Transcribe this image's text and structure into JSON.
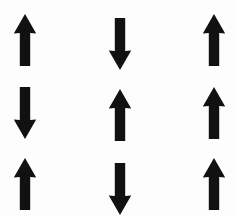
{
  "stimulus": {
    "title": "Arrow Grid",
    "background_color": "#fdfdfd",
    "arrow_color": "#111111",
    "columns": 3,
    "rows": 3,
    "width": 237,
    "height": 216,
    "cells": [
      {
        "row": 1,
        "col": 1,
        "direction": "up",
        "glyph": "↑",
        "icon_name": "arrow-up-icon"
      },
      {
        "row": 1,
        "col": 2,
        "direction": "down",
        "glyph": "↓",
        "icon_name": "arrow-down-icon"
      },
      {
        "row": 1,
        "col": 3,
        "direction": "up",
        "glyph": "↑",
        "icon_name": "arrow-up-icon"
      },
      {
        "row": 2,
        "col": 1,
        "direction": "down",
        "glyph": "↓",
        "icon_name": "arrow-down-icon"
      },
      {
        "row": 2,
        "col": 2,
        "direction": "up",
        "glyph": "↑",
        "icon_name": "arrow-up-icon"
      },
      {
        "row": 2,
        "col": 3,
        "direction": "up",
        "glyph": "↑",
        "icon_name": "arrow-up-icon"
      },
      {
        "row": 3,
        "col": 1,
        "direction": "up",
        "glyph": "↑",
        "icon_name": "arrow-up-icon"
      },
      {
        "row": 3,
        "col": 2,
        "direction": "down",
        "glyph": "↓",
        "icon_name": "arrow-down-icon"
      },
      {
        "row": 3,
        "col": 3,
        "direction": "up",
        "glyph": "↑",
        "icon_name": "arrow-up-icon"
      }
    ],
    "counts": {
      "up": 6,
      "down": 3,
      "total": 9
    }
  }
}
